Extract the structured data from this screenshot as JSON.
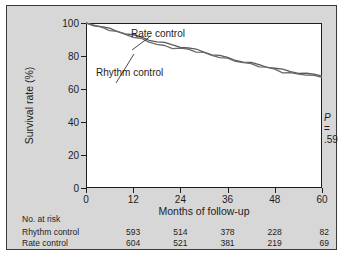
{
  "chart_data": {
    "type": "line",
    "title": "",
    "xlabel": "Months of follow-up",
    "ylabel": "Survival rate (%)",
    "xlim": [
      0,
      60
    ],
    "ylim": [
      0,
      100
    ],
    "xticks": [
      0,
      12,
      24,
      36,
      48,
      60
    ],
    "yticks": [
      0,
      20,
      40,
      60,
      80,
      100
    ],
    "grid": false,
    "legend_position": "inline-annotations",
    "annotations": [
      {
        "name": "p-value",
        "text_prefix": "P",
        "text_suffix": " = .59",
        "x": 48,
        "y": 46
      },
      {
        "name": "rate-control-label",
        "text": "Rate control"
      },
      {
        "name": "rhythm-control-label",
        "text": "Rhythm control"
      }
    ],
    "series": [
      {
        "name": "Rate control",
        "color": "#5a5a5a",
        "x": [
          0,
          2,
          4,
          6,
          8,
          10,
          12,
          14,
          16,
          18,
          20,
          22,
          24,
          26,
          28,
          30,
          32,
          34,
          36,
          38,
          40,
          42,
          44,
          46,
          48,
          50,
          52,
          54,
          56,
          58,
          60
        ],
        "y": [
          100,
          98.8,
          97.6,
          96.4,
          95.1,
          93.8,
          92.5,
          91.2,
          90.0,
          88.8,
          87.7,
          86.7,
          85.8,
          84.8,
          83.7,
          82.5,
          81.2,
          80.0,
          78.8,
          77.7,
          76.6,
          75.6,
          74.6,
          73.6,
          72.6,
          71.5,
          70.7,
          70.0,
          69.3,
          68.5,
          67.8
        ]
      },
      {
        "name": "Rhythm control",
        "color": "#6a6a6a",
        "x": [
          0,
          2,
          4,
          6,
          8,
          10,
          12,
          14,
          16,
          18,
          20,
          22,
          24,
          26,
          28,
          30,
          32,
          34,
          36,
          38,
          40,
          42,
          44,
          46,
          48,
          50,
          52,
          54,
          56,
          58,
          60
        ],
        "y": [
          100,
          98.6,
          97.2,
          95.9,
          94.5,
          93.1,
          91.7,
          90.2,
          88.7,
          87.2,
          85.9,
          85.0,
          84.6,
          83.9,
          82.9,
          81.7,
          80.5,
          79.3,
          78.2,
          77.1,
          76.0,
          75.0,
          74.0,
          73.0,
          71.9,
          70.3,
          69.4,
          69.2,
          68.6,
          67.8,
          67.0
        ]
      }
    ],
    "risk_table": {
      "title": "No. at risk",
      "times": [
        0,
        12,
        24,
        36,
        48,
        60
      ],
      "rows": [
        {
          "label": "Rhythm control",
          "values": [
            "593",
            "514",
            "378",
            "228",
            "82"
          ]
        },
        {
          "label": "Rate control",
          "values": [
            "604",
            "521",
            "381",
            "219",
            "69"
          ]
        }
      ]
    }
  },
  "colors": {
    "figure_background": "#d7d7d7",
    "plot_background": "#ffffff",
    "axis": "#1d1d1d",
    "border": "#3a3a3a"
  }
}
